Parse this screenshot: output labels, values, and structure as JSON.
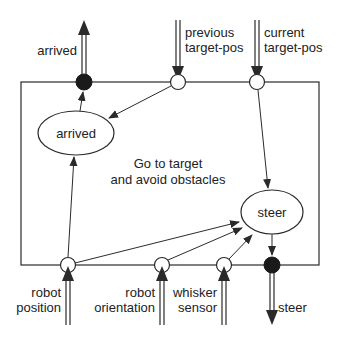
{
  "diagram": {
    "box_label_line1": "Go to target",
    "box_label_line2": "and avoid obstacles",
    "nodes": {
      "arrived": "arrived",
      "steer": "steer"
    },
    "ports": {
      "out_arrived": "arrived",
      "in_previous_line1": "previous",
      "in_previous_line2": "target-pos",
      "in_current_line1": "current",
      "in_current_line2": "target-pos",
      "in_robot_position_line1": "robot",
      "in_robot_position_line2": "position",
      "in_robot_orientation_line1": "robot",
      "in_robot_orientation_line2": "orientation",
      "in_whisker_line1": "whisker",
      "in_whisker_line2": "sensor",
      "out_steer": "steer"
    },
    "colors": {
      "stroke": "#2a2a2a",
      "filled_port": "#1a1a1a",
      "background": "#ffffff"
    }
  }
}
